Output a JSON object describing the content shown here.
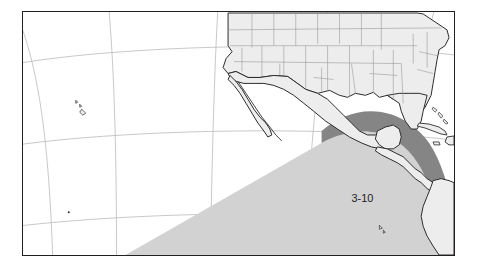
{
  "map": {
    "title": "Eastern Pacific tropical cyclone forecast map",
    "projection": "lambert-conformal-conic",
    "frame": {
      "x": 22,
      "y": 11,
      "width": 433,
      "height": 245
    },
    "colors": {
      "background": "#ffffff",
      "ocean": "#ffffff",
      "land_fill": "#ededed",
      "coastline": "#2b2b2b",
      "state_border": "#9a9a9a",
      "graticule": "#b9b9b9",
      "frame_border": "#231f20",
      "zone_outer_fill": "#d2d2d2",
      "zone_coastal_fill": "#858585",
      "label_text": "#1c1c1c"
    },
    "annotations": [
      {
        "name": "zone-label-3-10",
        "text": "3-10",
        "x": 352,
        "y": 188,
        "font_size": 11
      }
    ],
    "zones": [
      {
        "name": "outer-shaded-zone",
        "fill": "#d2d2d2",
        "description": "large light gray shaded area over the eastern Pacific with a straight diagonal southwest edge"
      },
      {
        "name": "coastal-shaded-band",
        "fill": "#858585",
        "description": "darker gray band hugging the Pacific coast of Mexico, Central America and northwest South America"
      }
    ],
    "graticule": {
      "visible": true,
      "meridians": 4,
      "parallels": 3,
      "stroke": "#b9b9b9",
      "stroke_width": 0.8
    },
    "features": [
      {
        "name": "united-states",
        "type": "country",
        "has_internal_borders": true
      },
      {
        "name": "mexico",
        "type": "country",
        "has_internal_borders": false
      },
      {
        "name": "baja-california-peninsula",
        "type": "peninsula"
      },
      {
        "name": "central-america",
        "type": "region"
      },
      {
        "name": "colombia-ecuador",
        "type": "region"
      },
      {
        "name": "cuba",
        "type": "island"
      },
      {
        "name": "hispaniola",
        "type": "island"
      },
      {
        "name": "jamaica",
        "type": "island"
      },
      {
        "name": "bahamas",
        "type": "island-group"
      },
      {
        "name": "hawaiian-islands",
        "type": "island-group"
      },
      {
        "name": "galapagos-islands",
        "type": "island-group"
      },
      {
        "name": "clipperton-island",
        "type": "island"
      }
    ]
  }
}
